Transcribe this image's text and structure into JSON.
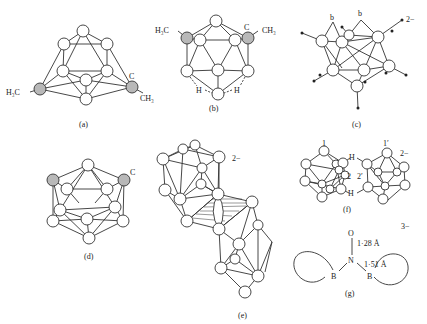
{
  "figure": {
    "panels": [
      {
        "id": "a",
        "caption": "(a)",
        "labels": {
          "left": "H₃C",
          "right_c": "C",
          "right": "CH₃"
        }
      },
      {
        "id": "b",
        "caption": "(b)",
        "labels": {
          "left": "H₃C",
          "right_c": "C",
          "right": "CH₃",
          "h_left": "H",
          "h_right": "H"
        }
      },
      {
        "id": "c",
        "caption": "(c)",
        "labels": {
          "b1": "b",
          "b2": "b",
          "charge": "2−"
        }
      },
      {
        "id": "d",
        "caption": "(d)",
        "labels": {
          "c": "C"
        }
      },
      {
        "id": "e",
        "caption": "(e)",
        "labels": {
          "charge": "2−"
        }
      },
      {
        "id": "f",
        "caption": "(f)",
        "labels": {
          "one": "1",
          "one_prime": "1′",
          "two": "2",
          "two_prime": "2′",
          "h_top": "H",
          "h_bottom": "H",
          "charge": "2−"
        }
      },
      {
        "id": "g",
        "caption": "(g)",
        "labels": {
          "o": "O",
          "n": "N",
          "b_left": "B",
          "b_right": "B",
          "no_dist": "1·28 Å",
          "nb_dist": "1·51 Å",
          "charge": "3−"
        }
      }
    ]
  }
}
